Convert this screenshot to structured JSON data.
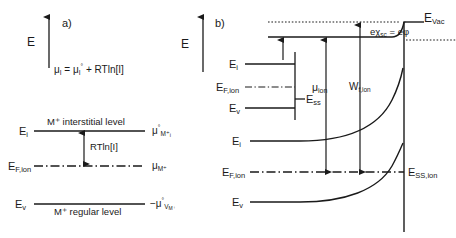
{
  "figure": {
    "width": 456,
    "height": 238,
    "background": "#ffffff",
    "line_color": "#1a1a1a",
    "text_color": "#1a1a1a"
  },
  "panel_a": {
    "tag": "a)",
    "axis_label": "E",
    "equation": {
      "mu": "μ",
      "sub_i": "I",
      "equals": "=",
      "mu0": "μ",
      "sup_0": "°",
      "plus_rt": "+ RTln[I]",
      "full": "μᵢ = μᵢ° + RTln[I]"
    },
    "levels": [
      {
        "name": "interstitial",
        "left_label": "E",
        "left_sub": "i",
        "caption": "M⁺ interstitial level",
        "right_label": "μ",
        "right_sup": "°",
        "right_sub": "M⁺",
        "right_subsub": "i",
        "style": "solid"
      },
      {
        "name": "fermi-ion",
        "left_label": "E",
        "left_sub": "F,ion",
        "caption": "",
        "right_label": "μ",
        "right_sup": "",
        "right_sub": "M⁺",
        "right_subsub": "",
        "style": "dash-dot"
      },
      {
        "name": "regular",
        "left_label": "E",
        "left_sub": "v",
        "caption": "M⁺ regular level",
        "right_label": "−μ",
        "right_sup": "°",
        "right_sub": "V",
        "right_subsub": "M⁺",
        "style": "solid"
      }
    ],
    "arrow_label": "RTln[I]"
  },
  "panel_b": {
    "tag": "b)",
    "axis_label": "E",
    "levels": [
      {
        "name": "interstitial-bulk",
        "label": "E",
        "sub": "i",
        "style": "solid"
      },
      {
        "name": "fermi-ion-bulk",
        "label": "E",
        "sub": "F,ion",
        "style": "dash-dot"
      },
      {
        "name": "valence-bulk",
        "label": "E",
        "sub": "v",
        "style": "solid"
      },
      {
        "name": "surface-state",
        "label": "E",
        "sub": "ss",
        "style": "solid"
      },
      {
        "name": "interstitial-band",
        "label": "E",
        "sub": "i",
        "style": "curve"
      },
      {
        "name": "fermi-ion-band",
        "label": "E",
        "sub": "F,ion",
        "style": "dash-dot"
      },
      {
        "name": "valence-band",
        "label": "E",
        "sub": "v",
        "style": "curve"
      },
      {
        "name": "surface-state-ion",
        "label": "E",
        "sub": "SS,ion",
        "style": "solid"
      }
    ],
    "vacuum_level": {
      "label": "E",
      "sub": "Vac"
    },
    "arrows": [
      {
        "name": "mu-ion",
        "label": "μ",
        "sub": "ion"
      },
      {
        "name": "work-function-ion",
        "label": "W",
        "sub": "f,ion"
      }
    ],
    "surface_potential": {
      "e_chi": "eχ",
      "chi_sub": "sc",
      "equals": "=",
      "e_phi": "eφ",
      "full": "eχₛᴄ = eφ"
    }
  }
}
